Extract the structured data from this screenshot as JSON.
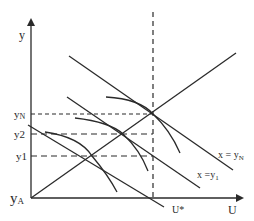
{
  "diagram": {
    "axes": {
      "y_label": "y",
      "x_label": "U",
      "origin_label_main": "y",
      "origin_label_sub": "A"
    },
    "levels": {
      "yN_main": "y",
      "yN_sub": "N",
      "y2": "y2",
      "y1": "y1"
    },
    "lines": {
      "xN_label_main": "x = y",
      "xN_label_sub": "N",
      "x1_label_main": "x =y",
      "x1_label_sub": "1"
    },
    "markers": {
      "u_star": "U*"
    },
    "colors": {
      "ink": "#2a2a2a",
      "background": "#ffffff"
    }
  }
}
